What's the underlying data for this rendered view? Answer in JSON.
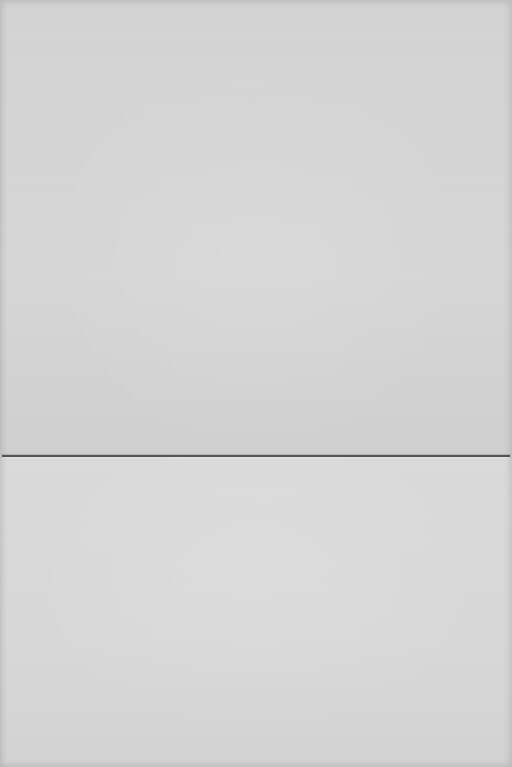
{
  "image": {
    "subject": "blank folded paper card",
    "colors": {
      "paper": "#d6d6d6",
      "fold_line": "#555555"
    }
  }
}
